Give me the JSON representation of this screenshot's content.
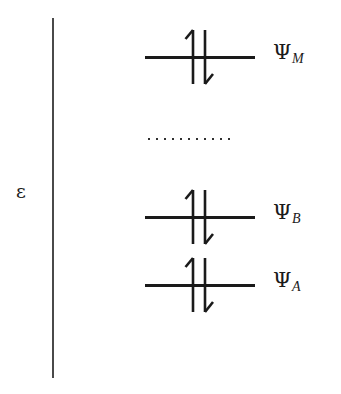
{
  "figure": {
    "type": "energy-level-diagram",
    "axis": {
      "label": "ε",
      "label_meaning": "epsilon-energy-axis",
      "orientation": "vertical",
      "color": "#4a4a4a"
    },
    "continuation_marker": {
      "glyph": "·",
      "dot_count": 11,
      "meaning": "intermediate levels omitted"
    },
    "levels": [
      {
        "id": "psi-M",
        "symbol": "Ψ",
        "subscript": "M",
        "top": 57,
        "electrons": [
          "up",
          "down"
        ],
        "occupancy": 2
      },
      {
        "id": "psi-B",
        "symbol": "Ψ",
        "subscript": "B",
        "top": 217,
        "electrons": [
          "up",
          "down"
        ],
        "occupancy": 2
      },
      {
        "id": "psi-A",
        "symbol": "Ψ",
        "subscript": "A",
        "top": 285,
        "electrons": [
          "up",
          "down"
        ],
        "occupancy": 2
      }
    ],
    "colors": {
      "line": "#1a1a1a",
      "axis": "#4a4a4a",
      "background": "#ffffff"
    }
  }
}
